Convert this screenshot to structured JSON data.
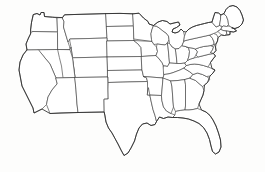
{
  "map": {
    "title": "United States",
    "subtitle": "",
    "projection": "albers-usa",
    "region": "Contiguous United States",
    "background_color": "#fdfdfc",
    "fill_color": "#ffffff",
    "border_color": "#3a3a3a",
    "outline_color": "#2b2b2b",
    "labels_visible": false,
    "legend_visible": false,
    "state_count": 49,
    "states": [
      {
        "code": "WA",
        "name": "Washington"
      },
      {
        "code": "OR",
        "name": "Oregon"
      },
      {
        "code": "CA",
        "name": "California"
      },
      {
        "code": "NV",
        "name": "Nevada"
      },
      {
        "code": "ID",
        "name": "Idaho"
      },
      {
        "code": "MT",
        "name": "Montana"
      },
      {
        "code": "WY",
        "name": "Wyoming"
      },
      {
        "code": "UT",
        "name": "Utah"
      },
      {
        "code": "AZ",
        "name": "Arizona"
      },
      {
        "code": "NM",
        "name": "New Mexico"
      },
      {
        "code": "CO",
        "name": "Colorado"
      },
      {
        "code": "ND",
        "name": "North Dakota"
      },
      {
        "code": "SD",
        "name": "South Dakota"
      },
      {
        "code": "NE",
        "name": "Nebraska"
      },
      {
        "code": "KS",
        "name": "Kansas"
      },
      {
        "code": "OK",
        "name": "Oklahoma"
      },
      {
        "code": "TX",
        "name": "Texas"
      },
      {
        "code": "MN",
        "name": "Minnesota"
      },
      {
        "code": "IA",
        "name": "Iowa"
      },
      {
        "code": "MO",
        "name": "Missouri"
      },
      {
        "code": "AR",
        "name": "Arkansas"
      },
      {
        "code": "LA",
        "name": "Louisiana"
      },
      {
        "code": "WI",
        "name": "Wisconsin"
      },
      {
        "code": "IL",
        "name": "Illinois"
      },
      {
        "code": "MI",
        "name": "Michigan"
      },
      {
        "code": "IN",
        "name": "Indiana"
      },
      {
        "code": "OH",
        "name": "Ohio"
      },
      {
        "code": "KY",
        "name": "Kentucky"
      },
      {
        "code": "TN",
        "name": "Tennessee"
      },
      {
        "code": "MS",
        "name": "Mississippi"
      },
      {
        "code": "AL",
        "name": "Alabama"
      },
      {
        "code": "GA",
        "name": "Georgia"
      },
      {
        "code": "FL",
        "name": "Florida"
      },
      {
        "code": "SC",
        "name": "South Carolina"
      },
      {
        "code": "NC",
        "name": "North Carolina"
      },
      {
        "code": "VA",
        "name": "Virginia"
      },
      {
        "code": "WV",
        "name": "West Virginia"
      },
      {
        "code": "MD",
        "name": "Maryland"
      },
      {
        "code": "DE",
        "name": "Delaware"
      },
      {
        "code": "PA",
        "name": "Pennsylvania"
      },
      {
        "code": "NJ",
        "name": "New Jersey"
      },
      {
        "code": "NY",
        "name": "New York"
      },
      {
        "code": "CT",
        "name": "Connecticut"
      },
      {
        "code": "RI",
        "name": "Rhode Island"
      },
      {
        "code": "MA",
        "name": "Massachusetts"
      },
      {
        "code": "VT",
        "name": "Vermont"
      },
      {
        "code": "NH",
        "name": "New Hampshire"
      },
      {
        "code": "ME",
        "name": "Maine"
      }
    ]
  }
}
